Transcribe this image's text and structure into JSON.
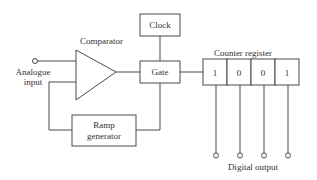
{
  "diagram": {
    "title": "",
    "labels": {
      "comparator": "Comparator",
      "analogue_input_line1": "Analogue",
      "analogue_input_line2": "input",
      "clock": "Clock",
      "gate": "Gate",
      "ramp_line1": "Ramp",
      "ramp_line2": "generator",
      "counter_register": "Counter register",
      "digital_output": "Digital output"
    },
    "register_bits": [
      "1",
      "0",
      "0",
      "1"
    ],
    "colors": {
      "line": "#4a4a4a",
      "text": "#333333",
      "background": "#ffffff"
    }
  }
}
